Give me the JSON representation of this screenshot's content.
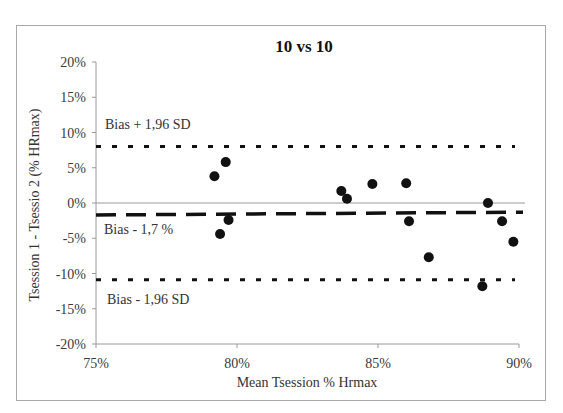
{
  "chart_data": {
    "type": "scatter",
    "title": "10 vs 10",
    "xlabel": "Mean Tsession % Hrmax",
    "ylabel": "Tsession 1 - Tsessio 2 (%  HRmax)",
    "xlim": [
      75,
      90
    ],
    "ylim": [
      -20,
      20
    ],
    "x_ticks": [
      "75%",
      "80%",
      "85%",
      "90%"
    ],
    "y_ticks": [
      "20%",
      "15%",
      "10%",
      "5%",
      "0%",
      "-5%",
      "-10%",
      "-15%",
      "-20%"
    ],
    "grid": false,
    "legend": null,
    "series": [
      {
        "name": "Differences",
        "points": [
          {
            "x": 79.2,
            "y": 3.8
          },
          {
            "x": 79.6,
            "y": 5.8
          },
          {
            "x": 79.4,
            "y": -4.4
          },
          {
            "x": 79.7,
            "y": -2.4
          },
          {
            "x": 83.7,
            "y": 1.7
          },
          {
            "x": 83.9,
            "y": 0.6
          },
          {
            "x": 84.8,
            "y": 2.7
          },
          {
            "x": 86.0,
            "y": 2.8
          },
          {
            "x": 86.1,
            "y": -2.6
          },
          {
            "x": 86.8,
            "y": -7.7
          },
          {
            "x": 88.9,
            "y": 0.0
          },
          {
            "x": 89.4,
            "y": -2.6
          },
          {
            "x": 89.8,
            "y": -5.5
          },
          {
            "x": 88.7,
            "y": -11.8
          }
        ]
      }
    ],
    "reference_lines": [
      {
        "name": "upper-limit",
        "label": "Bias + 1,96 SD",
        "y_start": 8.0,
        "y_end": 8.0,
        "style": "dotted"
      },
      {
        "name": "bias",
        "label": "Bias - 1,7 %",
        "y_start": -1.7,
        "y_end": -1.3,
        "style": "dashed"
      },
      {
        "name": "lower-limit",
        "label": "Bias - 1,96 SD",
        "y_start": -10.9,
        "y_end": -10.9,
        "style": "dotted"
      },
      {
        "name": "zero-line",
        "label": "",
        "y_start": 0,
        "y_end": 0,
        "style": "solid"
      }
    ],
    "annotations": [
      "Bias + 1,96 SD",
      "Bias - 1,7 %",
      "Bias - 1,96 SD"
    ]
  },
  "colors": {
    "points": "#111111",
    "lines": "#111111",
    "axis": "#9a9a9a",
    "frame": "#a8a8a8"
  }
}
